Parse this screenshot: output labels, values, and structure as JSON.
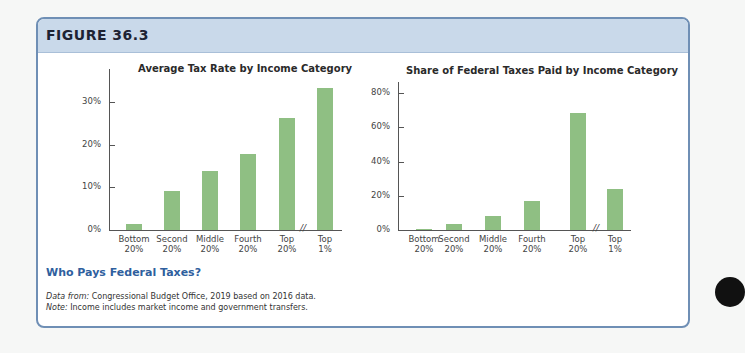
{
  "figure": {
    "label": "FIGURE 36.3",
    "caption_title": "Who Pays Federal Taxes?",
    "note_source_prefix": "Data from:",
    "note_source_text": " Congressional Budget Office, 2019 based on 2016 data.",
    "note_prefix": "Note:",
    "note_text": " Income includes market income and government transfers."
  },
  "colors": {
    "bar": "#8fbf83",
    "header": "#c9d9ea",
    "border": "#6f8fb5",
    "caption": "#2f5f9e"
  },
  "chart_data": [
    {
      "type": "bar",
      "title": "Average Tax Rate by Income Category",
      "categories": [
        "Bottom 20%",
        "Second 20%",
        "Middle 20%",
        "Fourth 20%",
        "Top 20%",
        "Top 1%"
      ],
      "category_lines": [
        [
          "Bottom",
          "20%"
        ],
        [
          "Second",
          "20%"
        ],
        [
          "Middle",
          "20%"
        ],
        [
          "Fourth",
          "20%"
        ],
        [
          "Top",
          "20%"
        ],
        [
          "Top",
          "1%"
        ]
      ],
      "values": [
        1.4,
        9.2,
        13.8,
        17.8,
        26.4,
        33.3
      ],
      "xlabel": "",
      "ylabel": "",
      "ylim": [
        0,
        35
      ],
      "yticks": [
        0,
        10,
        20,
        30
      ],
      "ytick_labels": [
        "0%",
        "10%",
        "20%",
        "30%"
      ],
      "axis_break": "between Top 20% and Top 1%",
      "grid": false,
      "legend": "none"
    },
    {
      "type": "bar",
      "title": "Share of Federal Taxes Paid by Income Category",
      "categories": [
        "Bottom 20%",
        "Second 20%",
        "Middle 20%",
        "Fourth 20%",
        "Top 20%",
        "Top 1%"
      ],
      "category_lines": [
        [
          "Bottom",
          "20%"
        ],
        [
          "Second",
          "20%"
        ],
        [
          "Middle",
          "20%"
        ],
        [
          "Fourth",
          "20%"
        ],
        [
          "Top",
          "20%"
        ],
        [
          "Top",
          "1%"
        ]
      ],
      "values": [
        0.2,
        3.7,
        8.2,
        17.0,
        68.2,
        24.0
      ],
      "xlabel": "",
      "ylabel": "",
      "ylim": [
        0,
        85
      ],
      "yticks": [
        0,
        20,
        40,
        60,
        80
      ],
      "ytick_labels": [
        "0%",
        "20%",
        "40%",
        "60%",
        "80%"
      ],
      "axis_break": "between Top 20% and Top 1%",
      "grid": false,
      "legend": "none"
    }
  ]
}
